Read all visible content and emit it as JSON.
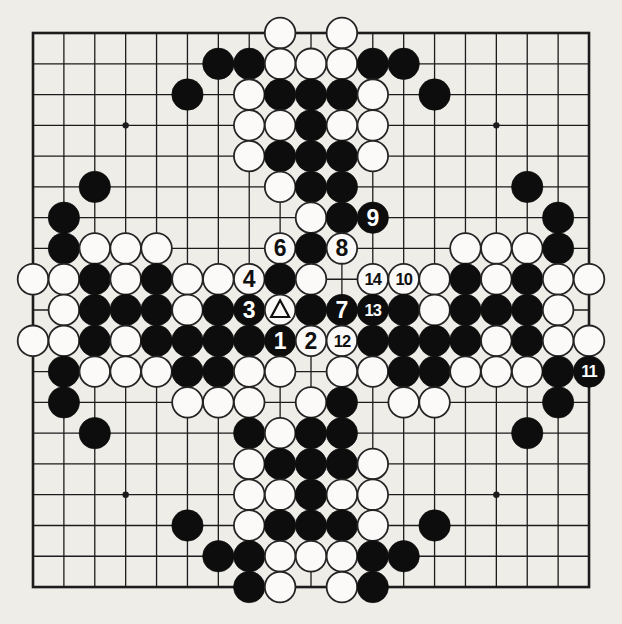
{
  "page": {
    "kind": "go-book-diagram-scan",
    "paper_color": "#efede8"
  },
  "board": {
    "type": "go-diagram",
    "size": 19,
    "geometry": {
      "origin_x": 33,
      "origin_y": 33,
      "cell_w": 30.89,
      "cell_h": 30.78,
      "stone_radius_black": 15.7,
      "stone_radius_white": 15.3,
      "star_radius": 3.2,
      "inner_line_width": 1.3,
      "border_line_width": 2.6
    },
    "colors": {
      "line": "#1c1c1c",
      "black_stone": "#0d0d0d",
      "white_stone_fill": "#fbfaf8",
      "white_stone_stroke": "#242424",
      "label_on_black": "#ffffff",
      "label_on_white": "#101010",
      "triangle_marker": "#101010"
    },
    "star_points": [
      [
        3,
        3
      ],
      [
        9,
        3
      ],
      [
        15,
        3
      ],
      [
        3,
        9
      ],
      [
        9,
        9
      ],
      [
        15,
        9
      ],
      [
        3,
        15
      ],
      [
        9,
        15
      ],
      [
        15,
        15
      ]
    ],
    "visible_move_numbers": [
      "1",
      "2",
      "3",
      "4",
      "6",
      "7",
      "8",
      "9",
      "10",
      "11",
      "12",
      "13",
      "14"
    ],
    "marked_stone": {
      "col": 8,
      "row": 9,
      "color": "white",
      "marker": "triangle"
    },
    "stones_format": [
      "col(0=left)",
      "row(0=top)",
      "color b|w",
      "label",
      "marker"
    ],
    "stones": [
      [
        8,
        0,
        "w"
      ],
      [
        10,
        0,
        "w"
      ],
      [
        6,
        1,
        "b"
      ],
      [
        7,
        1,
        "b"
      ],
      [
        8,
        1,
        "w"
      ],
      [
        9,
        1,
        "w"
      ],
      [
        10,
        1,
        "w"
      ],
      [
        11,
        1,
        "b"
      ],
      [
        12,
        1,
        "b"
      ],
      [
        5,
        2,
        "b"
      ],
      [
        7,
        2,
        "w"
      ],
      [
        8,
        2,
        "b"
      ],
      [
        9,
        2,
        "b"
      ],
      [
        10,
        2,
        "b"
      ],
      [
        11,
        2,
        "w"
      ],
      [
        13,
        2,
        "b"
      ],
      [
        7,
        3,
        "w"
      ],
      [
        8,
        3,
        "w"
      ],
      [
        9,
        3,
        "b"
      ],
      [
        10,
        3,
        "w"
      ],
      [
        11,
        3,
        "w"
      ],
      [
        7,
        4,
        "w"
      ],
      [
        8,
        4,
        "b"
      ],
      [
        9,
        4,
        "b"
      ],
      [
        10,
        4,
        "b"
      ],
      [
        11,
        4,
        "w"
      ],
      [
        2,
        5,
        "b"
      ],
      [
        8,
        5,
        "w"
      ],
      [
        9,
        5,
        "b"
      ],
      [
        10,
        5,
        "b"
      ],
      [
        16,
        5,
        "b"
      ],
      [
        1,
        6,
        "b"
      ],
      [
        9,
        6,
        "w"
      ],
      [
        10,
        6,
        "b"
      ],
      [
        11,
        6,
        "b",
        "9"
      ],
      [
        17,
        6,
        "b"
      ],
      [
        1,
        7,
        "b"
      ],
      [
        2,
        7,
        "w"
      ],
      [
        3,
        7,
        "w"
      ],
      [
        4,
        7,
        "w"
      ],
      [
        8,
        7,
        "w",
        "6"
      ],
      [
        9,
        7,
        "b"
      ],
      [
        10,
        7,
        "w",
        "8"
      ],
      [
        14,
        7,
        "w"
      ],
      [
        15,
        7,
        "w"
      ],
      [
        16,
        7,
        "w"
      ],
      [
        17,
        7,
        "b"
      ],
      [
        0,
        8,
        "w"
      ],
      [
        1,
        8,
        "w"
      ],
      [
        2,
        8,
        "b"
      ],
      [
        3,
        8,
        "w"
      ],
      [
        4,
        8,
        "b"
      ],
      [
        5,
        8,
        "w"
      ],
      [
        6,
        8,
        "w"
      ],
      [
        7,
        8,
        "w",
        "4"
      ],
      [
        8,
        8,
        "b"
      ],
      [
        9,
        8,
        "w"
      ],
      [
        11,
        8,
        "w",
        "14"
      ],
      [
        12,
        8,
        "w",
        "10"
      ],
      [
        13,
        8,
        "w"
      ],
      [
        14,
        8,
        "b"
      ],
      [
        15,
        8,
        "w"
      ],
      [
        16,
        8,
        "b"
      ],
      [
        17,
        8,
        "w"
      ],
      [
        18,
        8,
        "w"
      ],
      [
        1,
        9,
        "w"
      ],
      [
        2,
        9,
        "b"
      ],
      [
        3,
        9,
        "b"
      ],
      [
        4,
        9,
        "b"
      ],
      [
        5,
        9,
        "w"
      ],
      [
        6,
        9,
        "b"
      ],
      [
        7,
        9,
        "b",
        "3"
      ],
      [
        8,
        9,
        "w",
        "",
        "triangle"
      ],
      [
        9,
        9,
        "b"
      ],
      [
        10,
        9,
        "b",
        "7"
      ],
      [
        11,
        9,
        "b",
        "13"
      ],
      [
        12,
        9,
        "b"
      ],
      [
        13,
        9,
        "w"
      ],
      [
        14,
        9,
        "b"
      ],
      [
        15,
        9,
        "b"
      ],
      [
        16,
        9,
        "b"
      ],
      [
        17,
        9,
        "w"
      ],
      [
        0,
        10,
        "w"
      ],
      [
        1,
        10,
        "w"
      ],
      [
        2,
        10,
        "b"
      ],
      [
        3,
        10,
        "w"
      ],
      [
        4,
        10,
        "b"
      ],
      [
        5,
        10,
        "b"
      ],
      [
        6,
        10,
        "b"
      ],
      [
        7,
        10,
        "b"
      ],
      [
        8,
        10,
        "b",
        "1"
      ],
      [
        9,
        10,
        "w",
        "2"
      ],
      [
        10,
        10,
        "w",
        "12"
      ],
      [
        11,
        10,
        "b"
      ],
      [
        12,
        10,
        "b"
      ],
      [
        13,
        10,
        "b"
      ],
      [
        14,
        10,
        "b"
      ],
      [
        15,
        10,
        "w"
      ],
      [
        16,
        10,
        "b"
      ],
      [
        17,
        10,
        "w"
      ],
      [
        18,
        10,
        "w"
      ],
      [
        1,
        11,
        "b"
      ],
      [
        2,
        11,
        "w"
      ],
      [
        3,
        11,
        "w"
      ],
      [
        4,
        11,
        "w"
      ],
      [
        5,
        11,
        "b"
      ],
      [
        6,
        11,
        "b"
      ],
      [
        7,
        11,
        "w"
      ],
      [
        8,
        11,
        "w"
      ],
      [
        10,
        11,
        "w"
      ],
      [
        11,
        11,
        "w"
      ],
      [
        12,
        11,
        "b"
      ],
      [
        13,
        11,
        "b"
      ],
      [
        14,
        11,
        "w"
      ],
      [
        15,
        11,
        "w"
      ],
      [
        16,
        11,
        "w"
      ],
      [
        17,
        11,
        "b"
      ],
      [
        18,
        11,
        "b",
        "11"
      ],
      [
        1,
        12,
        "b"
      ],
      [
        5,
        12,
        "w"
      ],
      [
        6,
        12,
        "w"
      ],
      [
        7,
        12,
        "w"
      ],
      [
        9,
        12,
        "w"
      ],
      [
        10,
        12,
        "b"
      ],
      [
        12,
        12,
        "w"
      ],
      [
        13,
        12,
        "w"
      ],
      [
        17,
        12,
        "b"
      ],
      [
        2,
        13,
        "b"
      ],
      [
        7,
        13,
        "b"
      ],
      [
        8,
        13,
        "w"
      ],
      [
        9,
        13,
        "b"
      ],
      [
        10,
        13,
        "b"
      ],
      [
        16,
        13,
        "b"
      ],
      [
        7,
        14,
        "w"
      ],
      [
        8,
        14,
        "b"
      ],
      [
        9,
        14,
        "b"
      ],
      [
        10,
        14,
        "b"
      ],
      [
        11,
        14,
        "w"
      ],
      [
        7,
        15,
        "w"
      ],
      [
        8,
        15,
        "w"
      ],
      [
        9,
        15,
        "b"
      ],
      [
        10,
        15,
        "w"
      ],
      [
        11,
        15,
        "w"
      ],
      [
        5,
        16,
        "b"
      ],
      [
        7,
        16,
        "w"
      ],
      [
        8,
        16,
        "b"
      ],
      [
        9,
        16,
        "b"
      ],
      [
        10,
        16,
        "b"
      ],
      [
        11,
        16,
        "w"
      ],
      [
        13,
        16,
        "b"
      ],
      [
        6,
        17,
        "b"
      ],
      [
        7,
        17,
        "b"
      ],
      [
        8,
        17,
        "w"
      ],
      [
        9,
        17,
        "w"
      ],
      [
        10,
        17,
        "w"
      ],
      [
        11,
        17,
        "b"
      ],
      [
        12,
        17,
        "b"
      ],
      [
        7,
        18,
        "b"
      ],
      [
        8,
        18,
        "w"
      ],
      [
        10,
        18,
        "w"
      ],
      [
        11,
        18,
        "b"
      ]
    ]
  }
}
